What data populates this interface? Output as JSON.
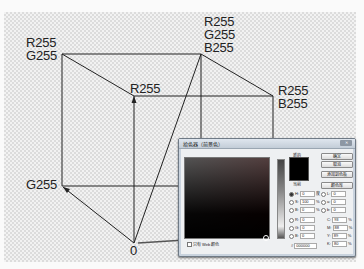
{
  "diagram": {
    "vertices": {
      "top_left_back": {
        "label_lines": [
          "R255",
          "G255"
        ]
      },
      "top_front": {
        "label_lines": [
          "R255"
        ]
      },
      "top_right_back": {
        "label_lines": [
          "R255",
          "G255",
          "B255"
        ]
      },
      "right_front": {
        "label_lines": [
          "R255",
          "B255"
        ]
      },
      "bottom_left": {
        "label_lines": [
          "G255"
        ]
      },
      "origin": {
        "label_lines": [
          "0"
        ]
      }
    }
  },
  "color_picker": {
    "title": "拾色器（前景色）",
    "close_label": "",
    "new_label": "新的",
    "current_label": "当前",
    "swatch_color": "#000000",
    "buttons": {
      "ok": "确定",
      "cancel": "取消",
      "add_to_swatches": "添加到色板",
      "color_libraries": "颜色库"
    },
    "hsb": [
      {
        "label": "H:",
        "value": "0",
        "unit": "度",
        "selected": true
      },
      {
        "label": "S:",
        "value": "100",
        "unit": "%",
        "selected": false
      },
      {
        "label": "B:",
        "value": "0",
        "unit": "%",
        "selected": false
      }
    ],
    "rgb": [
      {
        "label": "R:",
        "value": "0"
      },
      {
        "label": "G:",
        "value": "0"
      },
      {
        "label": "B:",
        "value": "0"
      }
    ],
    "lab": [
      {
        "label": "L:",
        "value": "0"
      },
      {
        "label": "a:",
        "value": "0"
      },
      {
        "label": "b:",
        "value": "0"
      }
    ],
    "cmyk": [
      {
        "label": "C:",
        "value": "93",
        "unit": "%"
      },
      {
        "label": "M:",
        "value": "88",
        "unit": "%"
      },
      {
        "label": "Y:",
        "value": "89",
        "unit": "%"
      },
      {
        "label": "K:",
        "value": "80",
        "unit": "%"
      }
    ],
    "hex_label": "#",
    "hex_value": "000000",
    "web_only_label": "只有 Web 颜色"
  }
}
